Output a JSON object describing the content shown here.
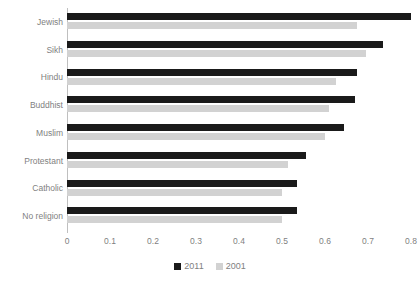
{
  "chart_data": {
    "type": "bar",
    "orientation": "horizontal",
    "title": "",
    "xlabel": "",
    "ylabel": "",
    "xlim": [
      0,
      0.8
    ],
    "xticks": [
      "0",
      "0.1",
      "0.2",
      "0.3",
      "0.4",
      "0.5",
      "0.6",
      "0.7",
      "0.8"
    ],
    "xtick_values": [
      0,
      0.1,
      0.2,
      0.3,
      0.4,
      0.5,
      0.6,
      0.7,
      0.8
    ],
    "grid": false,
    "legend_position": "bottom",
    "categories": [
      "Jewish",
      "Sikh",
      "Hindu",
      "Buddhist",
      "Muslim",
      "Protestant",
      "Catholic",
      "No religion"
    ],
    "series": [
      {
        "name": "2011",
        "color": "#1a1a1a",
        "values": [
          0.8,
          0.735,
          0.675,
          0.67,
          0.645,
          0.555,
          0.535,
          0.535
        ]
      },
      {
        "name": "2001",
        "color": "#d2d2d2",
        "values": [
          0.675,
          0.695,
          0.625,
          0.61,
          0.6,
          0.515,
          0.5,
          0.5
        ]
      }
    ]
  },
  "legend": {
    "items": [
      {
        "label": "2011",
        "swatch": "square-black-swatch"
      },
      {
        "label": "2001",
        "swatch": "square-gray-swatch"
      }
    ]
  },
  "colors": {
    "series_2011": "#1a1a1a",
    "series_2001": "#d2d2d2",
    "axis": "#bfbfbf",
    "text": "#7f7f7f",
    "background": "#ffffff"
  }
}
